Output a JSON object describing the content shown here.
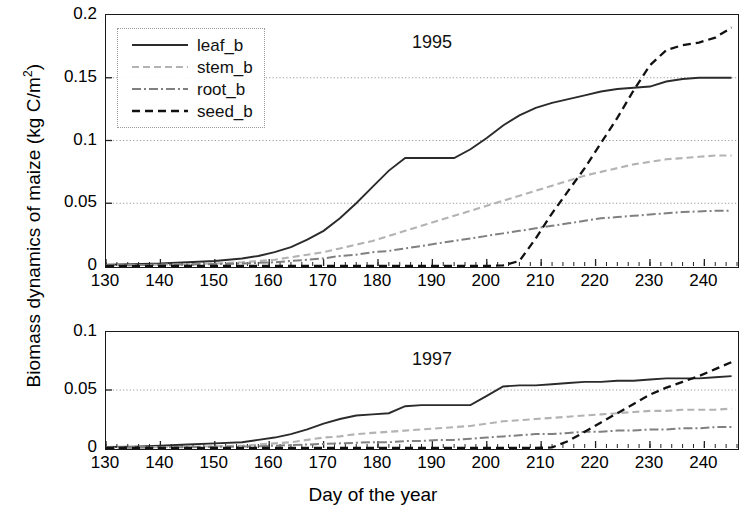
{
  "figure": {
    "ylabel": "Biomass dynamics of maize (kg C/m",
    "ylabel_sup": "2",
    "ylabel_tail": ")",
    "xlabel": "Day of the year"
  },
  "legend": {
    "items": [
      {
        "label": "leaf_b",
        "style": "solid",
        "color": "#2b2b2b"
      },
      {
        "label": "stem_b",
        "style": "dashed",
        "color": "#b3b3b3"
      },
      {
        "label": "root_b",
        "style": "dashdot",
        "color": "#808080"
      },
      {
        "label": "seed_b",
        "style": "dashed",
        "color": "#111111"
      }
    ]
  },
  "chart_data": [
    {
      "type": "line",
      "title": "1995",
      "panel": "top",
      "xlabel": "Day of the year",
      "ylabel": "Biomass dynamics of maize (kg C/m2)",
      "xlim": [
        130,
        246
      ],
      "ylim": [
        0,
        0.2
      ],
      "xticks": [
        130,
        140,
        150,
        160,
        170,
        180,
        190,
        200,
        210,
        220,
        230,
        240
      ],
      "yticks": [
        0,
        0.05,
        0.1,
        0.15,
        0.2
      ],
      "ytick_labels": [
        "0",
        "0.05",
        "0.1",
        "0.15",
        "0.2"
      ],
      "grid": "horizontal-dotted",
      "legend_position": "upper-left",
      "x": [
        130,
        135,
        140,
        145,
        150,
        155,
        158,
        161,
        164,
        167,
        170,
        173,
        176,
        179,
        182,
        185,
        188,
        191,
        194,
        197,
        200,
        203,
        206,
        209,
        212,
        215,
        218,
        221,
        224,
        227,
        230,
        233,
        236,
        239,
        242,
        245
      ],
      "series": [
        {
          "name": "leaf_b",
          "values": [
            0.001,
            0.0015,
            0.002,
            0.003,
            0.004,
            0.006,
            0.008,
            0.011,
            0.015,
            0.021,
            0.028,
            0.038,
            0.05,
            0.063,
            0.076,
            0.086,
            0.086,
            0.086,
            0.086,
            0.093,
            0.102,
            0.112,
            0.12,
            0.126,
            0.13,
            0.133,
            0.136,
            0.139,
            0.141,
            0.142,
            0.143,
            0.147,
            0.149,
            0.15,
            0.15,
            0.15
          ]
        },
        {
          "name": "stem_b",
          "values": [
            0.0005,
            0.0007,
            0.001,
            0.0015,
            0.002,
            0.003,
            0.004,
            0.005,
            0.007,
            0.009,
            0.011,
            0.014,
            0.017,
            0.02,
            0.024,
            0.028,
            0.032,
            0.036,
            0.04,
            0.044,
            0.048,
            0.052,
            0.056,
            0.06,
            0.064,
            0.068,
            0.072,
            0.075,
            0.078,
            0.081,
            0.083,
            0.085,
            0.086,
            0.087,
            0.088,
            0.088
          ]
        },
        {
          "name": "root_b",
          "values": [
            0.0005,
            0.0007,
            0.001,
            0.0012,
            0.0015,
            0.002,
            0.0025,
            0.003,
            0.004,
            0.005,
            0.006,
            0.008,
            0.009,
            0.011,
            0.012,
            0.014,
            0.016,
            0.018,
            0.02,
            0.022,
            0.024,
            0.026,
            0.028,
            0.03,
            0.032,
            0.034,
            0.036,
            0.038,
            0.039,
            0.04,
            0.041,
            0.042,
            0.043,
            0.0435,
            0.044,
            0.044
          ]
        },
        {
          "name": "seed_b",
          "values": [
            0,
            0,
            0,
            0,
            0,
            0,
            0,
            0,
            0,
            0,
            0,
            0,
            0,
            0,
            0,
            0,
            0,
            0,
            0,
            0,
            0,
            0.0005,
            0.004,
            0.022,
            0.042,
            0.06,
            0.078,
            0.098,
            0.118,
            0.14,
            0.16,
            0.172,
            0.176,
            0.178,
            0.182,
            0.19
          ]
        }
      ]
    },
    {
      "type": "line",
      "title": "1997",
      "panel": "bottom",
      "xlabel": "Day of the year",
      "ylabel": "Biomass dynamics of maize (kg C/m2)",
      "xlim": [
        130,
        246
      ],
      "ylim": [
        0,
        0.1
      ],
      "xticks": [
        130,
        140,
        150,
        160,
        170,
        180,
        190,
        200,
        210,
        220,
        230,
        240
      ],
      "yticks": [
        0,
        0.05,
        0.1
      ],
      "ytick_labels": [
        "0",
        "0.05",
        "0.1"
      ],
      "grid": "horizontal-dotted",
      "legend_position": "none",
      "x": [
        130,
        135,
        140,
        145,
        150,
        155,
        158,
        161,
        164,
        167,
        170,
        173,
        176,
        179,
        182,
        185,
        188,
        191,
        194,
        197,
        200,
        203,
        206,
        209,
        212,
        215,
        218,
        221,
        224,
        227,
        230,
        233,
        236,
        239,
        242,
        245
      ],
      "series": [
        {
          "name": "leaf_b",
          "values": [
            0.0008,
            0.0012,
            0.002,
            0.003,
            0.004,
            0.005,
            0.007,
            0.009,
            0.012,
            0.016,
            0.021,
            0.025,
            0.028,
            0.029,
            0.03,
            0.036,
            0.037,
            0.037,
            0.037,
            0.037,
            0.045,
            0.053,
            0.054,
            0.054,
            0.055,
            0.056,
            0.057,
            0.057,
            0.058,
            0.058,
            0.059,
            0.06,
            0.06,
            0.06,
            0.061,
            0.062
          ]
        },
        {
          "name": "stem_b",
          "values": [
            0.0003,
            0.0005,
            0.0008,
            0.001,
            0.0015,
            0.002,
            0.003,
            0.004,
            0.005,
            0.007,
            0.009,
            0.01,
            0.012,
            0.013,
            0.014,
            0.015,
            0.016,
            0.017,
            0.018,
            0.019,
            0.021,
            0.023,
            0.024,
            0.025,
            0.026,
            0.027,
            0.028,
            0.029,
            0.03,
            0.031,
            0.032,
            0.032,
            0.033,
            0.033,
            0.033,
            0.034
          ]
        },
        {
          "name": "root_b",
          "values": [
            0.0002,
            0.0003,
            0.0005,
            0.0007,
            0.001,
            0.0012,
            0.0015,
            0.002,
            0.0025,
            0.003,
            0.0035,
            0.004,
            0.0045,
            0.005,
            0.005,
            0.006,
            0.006,
            0.007,
            0.007,
            0.008,
            0.009,
            0.01,
            0.011,
            0.012,
            0.012,
            0.013,
            0.014,
            0.014,
            0.015,
            0.015,
            0.016,
            0.016,
            0.017,
            0.017,
            0.018,
            0.018
          ]
        },
        {
          "name": "seed_b",
          "values": [
            0,
            0,
            0,
            0,
            0,
            0,
            0,
            0,
            0,
            0,
            0,
            0,
            0,
            0,
            0,
            0,
            0,
            0,
            0,
            0,
            0,
            0,
            0,
            0,
            0.0005,
            0.006,
            0.014,
            0.022,
            0.03,
            0.038,
            0.046,
            0.052,
            0.057,
            0.062,
            0.068,
            0.074
          ]
        }
      ]
    }
  ]
}
